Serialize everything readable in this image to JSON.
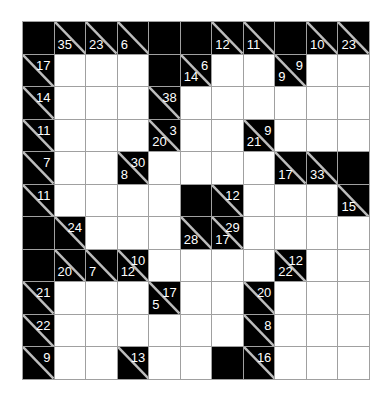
{
  "puzzle": {
    "type": "kakuro",
    "rows": 11,
    "cols": 11,
    "colors": {
      "block": "#000000",
      "empty": "#ffffff",
      "grid_line": "#a0a0a0",
      "clue_text": "#ffffff"
    },
    "legend": "Cell codes: B = solid block, W = empty entry cell, C = clue cell with down (bottom-left) and right (top-right) sums",
    "grid": [
      [
        {
          "t": "B"
        },
        {
          "t": "C",
          "down": "35",
          "right": ""
        },
        {
          "t": "C",
          "down": "23",
          "right": ""
        },
        {
          "t": "C",
          "down": "6",
          "right": ""
        },
        {
          "t": "B"
        },
        {
          "t": "B"
        },
        {
          "t": "C",
          "down": "12",
          "right": ""
        },
        {
          "t": "C",
          "down": "11",
          "right": ""
        },
        {
          "t": "B"
        },
        {
          "t": "C",
          "down": "10",
          "right": ""
        },
        {
          "t": "C",
          "down": "23",
          "right": ""
        }
      ],
      [
        {
          "t": "C",
          "down": "",
          "right": "17"
        },
        {
          "t": "W"
        },
        {
          "t": "W"
        },
        {
          "t": "W"
        },
        {
          "t": "B"
        },
        {
          "t": "C",
          "down": "14",
          "right": "6"
        },
        {
          "t": "W"
        },
        {
          "t": "W"
        },
        {
          "t": "C",
          "down": "9",
          "right": "9"
        },
        {
          "t": "W"
        },
        {
          "t": "W"
        }
      ],
      [
        {
          "t": "C",
          "down": "",
          "right": "14"
        },
        {
          "t": "W"
        },
        {
          "t": "W"
        },
        {
          "t": "W"
        },
        {
          "t": "C",
          "down": "",
          "right": "38"
        },
        {
          "t": "W"
        },
        {
          "t": "W"
        },
        {
          "t": "W"
        },
        {
          "t": "W"
        },
        {
          "t": "W"
        },
        {
          "t": "W"
        }
      ],
      [
        {
          "t": "C",
          "down": "",
          "right": "11"
        },
        {
          "t": "W"
        },
        {
          "t": "W"
        },
        {
          "t": "W"
        },
        {
          "t": "C",
          "down": "20",
          "right": "3"
        },
        {
          "t": "W"
        },
        {
          "t": "W"
        },
        {
          "t": "C",
          "down": "21",
          "right": "9"
        },
        {
          "t": "W"
        },
        {
          "t": "W"
        },
        {
          "t": "W"
        }
      ],
      [
        {
          "t": "C",
          "down": "",
          "right": "7"
        },
        {
          "t": "W"
        },
        {
          "t": "W"
        },
        {
          "t": "C",
          "down": "8",
          "right": "30"
        },
        {
          "t": "W"
        },
        {
          "t": "W"
        },
        {
          "t": "W"
        },
        {
          "t": "W"
        },
        {
          "t": "C",
          "down": "17",
          "right": ""
        },
        {
          "t": "C",
          "down": "33",
          "right": ""
        },
        {
          "t": "B"
        }
      ],
      [
        {
          "t": "C",
          "down": "",
          "right": "11"
        },
        {
          "t": "W"
        },
        {
          "t": "W"
        },
        {
          "t": "W"
        },
        {
          "t": "W"
        },
        {
          "t": "B"
        },
        {
          "t": "C",
          "down": "",
          "right": "12"
        },
        {
          "t": "W"
        },
        {
          "t": "W"
        },
        {
          "t": "W"
        },
        {
          "t": "C",
          "down": "15",
          "right": ""
        }
      ],
      [
        {
          "t": "B"
        },
        {
          "t": "C",
          "down": "",
          "right": "24"
        },
        {
          "t": "W"
        },
        {
          "t": "W"
        },
        {
          "t": "W"
        },
        {
          "t": "C",
          "down": "28",
          "right": ""
        },
        {
          "t": "C",
          "down": "17",
          "right": "29"
        },
        {
          "t": "W"
        },
        {
          "t": "W"
        },
        {
          "t": "W"
        },
        {
          "t": "W"
        }
      ],
      [
        {
          "t": "B"
        },
        {
          "t": "C",
          "down": "20",
          "right": ""
        },
        {
          "t": "C",
          "down": "7",
          "right": ""
        },
        {
          "t": "C",
          "down": "12",
          "right": "10"
        },
        {
          "t": "W"
        },
        {
          "t": "W"
        },
        {
          "t": "W"
        },
        {
          "t": "W"
        },
        {
          "t": "C",
          "down": "22",
          "right": "12"
        },
        {
          "t": "W"
        },
        {
          "t": "W"
        }
      ],
      [
        {
          "t": "C",
          "down": "",
          "right": "21"
        },
        {
          "t": "W"
        },
        {
          "t": "W"
        },
        {
          "t": "W"
        },
        {
          "t": "C",
          "down": "5",
          "right": "17"
        },
        {
          "t": "W"
        },
        {
          "t": "W"
        },
        {
          "t": "C",
          "down": "",
          "right": "20"
        },
        {
          "t": "W"
        },
        {
          "t": "W"
        },
        {
          "t": "W"
        }
      ],
      [
        {
          "t": "C",
          "down": "",
          "right": "22"
        },
        {
          "t": "W"
        },
        {
          "t": "W"
        },
        {
          "t": "W"
        },
        {
          "t": "W"
        },
        {
          "t": "W"
        },
        {
          "t": "W"
        },
        {
          "t": "C",
          "down": "",
          "right": "8"
        },
        {
          "t": "W"
        },
        {
          "t": "W"
        },
        {
          "t": "W"
        }
      ],
      [
        {
          "t": "C",
          "down": "",
          "right": "9"
        },
        {
          "t": "W"
        },
        {
          "t": "W"
        },
        {
          "t": "C",
          "down": "",
          "right": "13"
        },
        {
          "t": "W"
        },
        {
          "t": "W"
        },
        {
          "t": "B"
        },
        {
          "t": "C",
          "down": "",
          "right": "16"
        },
        {
          "t": "W"
        },
        {
          "t": "W"
        },
        {
          "t": "W"
        }
      ]
    ]
  }
}
